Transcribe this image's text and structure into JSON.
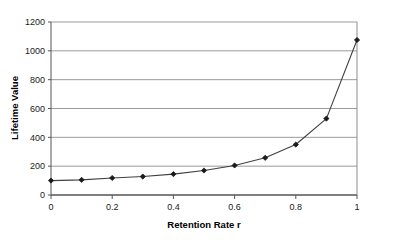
{
  "chart_data": {
    "type": "line",
    "title": "",
    "xlabel": "Retention Rate r",
    "ylabel": "Lifetime Value",
    "x": [
      0,
      0.1,
      0.2,
      0.3,
      0.4,
      0.5,
      0.6,
      0.7,
      0.8,
      0.9,
      1
    ],
    "values": [
      100,
      105,
      118,
      128,
      145,
      170,
      205,
      258,
      350,
      530,
      1075
    ],
    "series": [
      {
        "name": "Lifetime Value",
        "x": [
          0,
          0.1,
          0.2,
          0.3,
          0.4,
          0.5,
          0.6,
          0.7,
          0.8,
          0.9,
          1
        ],
        "values": [
          100,
          105,
          118,
          128,
          145,
          170,
          205,
          258,
          350,
          530,
          1075
        ]
      }
    ],
    "xlim": [
      0,
      1
    ],
    "ylim": [
      0,
      1200
    ],
    "xticks": [
      0,
      0.2,
      0.4,
      0.6,
      0.8,
      1
    ],
    "xtick_labels": [
      "0",
      "0.2",
      "0.4",
      "0.6",
      "0.8",
      "1"
    ],
    "yticks": [
      0,
      200,
      400,
      600,
      800,
      1000,
      1200
    ],
    "ytick_labels": [
      "0",
      "200",
      "400",
      "600",
      "800",
      "1000",
      "1200"
    ],
    "grid": "horizontal",
    "legend": "none",
    "marker": "diamond",
    "line_color": "#404040",
    "marker_color": "#1a1a1a",
    "grid_color": "#9a9a9a",
    "axis_color": "#555555",
    "background": "#ffffff"
  },
  "axes": {
    "x_title": "Retention Rate r",
    "y_title": "Lifetime Value"
  }
}
